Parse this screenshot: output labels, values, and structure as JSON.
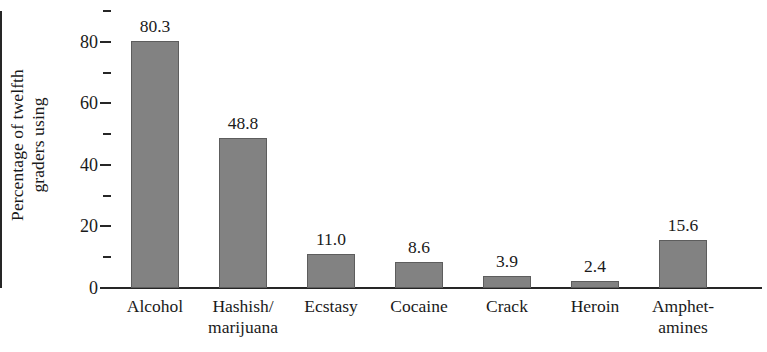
{
  "chart_data": {
    "type": "bar",
    "title": "",
    "subtitle": "",
    "xlabel": "",
    "ylabel": "Percentage of twelfth graders using",
    "ylabel_lines": [
      "Percentage of twelfth",
      "graders using"
    ],
    "categories": [
      "Alcohol",
      "Hashish/ marijuana",
      "Ecstasy",
      "Cocaine",
      "Crack",
      "Heroin",
      "Amphet- amines"
    ],
    "category_lines": [
      [
        "Alcohol"
      ],
      [
        "Hashish/",
        "marijuana"
      ],
      [
        "Ecstasy"
      ],
      [
        "Cocaine"
      ],
      [
        "Crack"
      ],
      [
        "Heroin"
      ],
      [
        "Amphet-",
        "amines"
      ]
    ],
    "values": [
      80.3,
      48.8,
      11.0,
      8.6,
      3.9,
      2.4,
      15.6
    ],
    "value_labels": [
      "80.3",
      "48.8",
      "11.0",
      "8.6",
      "3.9",
      "2.4",
      "15.6"
    ],
    "ylim": [
      0,
      90
    ],
    "y_major_ticks": [
      0,
      20,
      40,
      60,
      80
    ],
    "y_major_tick_labels": [
      "0",
      "20",
      "40",
      "60",
      "80"
    ],
    "y_minor_ticks": [
      10,
      30,
      50,
      70,
      90
    ],
    "grid": false,
    "legend": null,
    "bar_color": "#828282",
    "bar_edge_color": "#5d5d5d",
    "axis_color": "#262626",
    "background_color": "#ffffff",
    "text_color": "#1a1a1a"
  }
}
